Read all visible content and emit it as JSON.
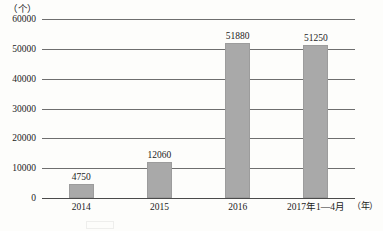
{
  "chart_data": {
    "type": "bar",
    "title": "",
    "subtitle": "",
    "xlabel": "（年）",
    "ylabel": "（个）",
    "categories": [
      "2014",
      "2015",
      "2016",
      "2017年1—4月"
    ],
    "values": [
      4750,
      12060,
      51880,
      51250
    ],
    "value_labels": [
      "4750",
      "12060",
      "51880",
      "51250"
    ],
    "series": [
      {
        "name": "",
        "values": [
          4750,
          12060,
          51880,
          51250
        ]
      }
    ],
    "ylim": [
      0,
      60000
    ],
    "ytick_values": [
      60000,
      50000,
      40000,
      30000,
      20000,
      10000,
      0
    ],
    "ytick_labels": [
      "60000",
      "50000",
      "40000",
      "30000",
      "20000",
      "10000",
      "0"
    ],
    "grid": true,
    "grid_axis": "y",
    "legend": false,
    "legend_position": "none",
    "bar_color": "#a9a9a9",
    "grid_color": "#6e6e6e",
    "background_color": "#fdfdfb",
    "text_color": "#1c1c1c"
  },
  "axes": {
    "y_unit_label": "（个）",
    "x_unit_label": "（年）"
  }
}
